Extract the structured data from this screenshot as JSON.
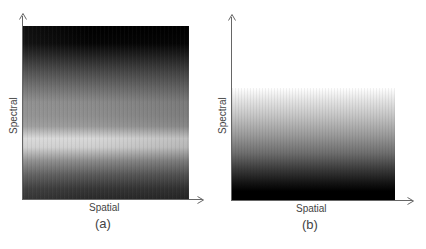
{
  "figure": {
    "panels": [
      {
        "id": "a",
        "caption": "(a)",
        "x_axis_label": "Spatial",
        "y_axis_label": "Spectral",
        "description": "grayscale spectral-spatial image, dark top, bright band near lower third"
      },
      {
        "id": "b",
        "caption": "(b)",
        "x_axis_label": "Spatial",
        "y_axis_label": "Spectral",
        "description": "grayscale gradient image, white at top fading to black at bottom"
      }
    ]
  }
}
